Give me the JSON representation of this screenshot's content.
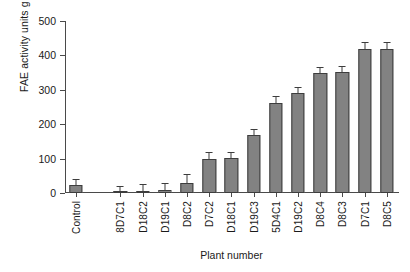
{
  "chart_data": {
    "type": "bar",
    "title": "",
    "xlabel": "Plant number",
    "ylabel": "FAE activity units g fresh wt",
    "ylabel_exponent": "−1",
    "ylim": [
      0,
      500
    ],
    "yticks": [
      0,
      100,
      200,
      300,
      400,
      500
    ],
    "grid": false,
    "legend": null,
    "bar_color": "#828282",
    "bar_edge_color": "#3d3d3d",
    "axis_color": "#4a4a4a",
    "categories": [
      "Control",
      "",
      "8D7C1",
      "D18C2",
      "D19C1",
      "D8C2",
      "D7C2",
      "D18C1",
      "D19C3",
      "5D4C1",
      "D19C2",
      "D8C4",
      "D8C3",
      "D7C1",
      "D8C5"
    ],
    "values": [
      23,
      null,
      2,
      7,
      10,
      30,
      98,
      101,
      168,
      262,
      290,
      348,
      353,
      420,
      420
    ],
    "errors": [
      15,
      null,
      16,
      17,
      16,
      21,
      18,
      16,
      16,
      17,
      15,
      14,
      14,
      16,
      16
    ]
  },
  "axis": {
    "y_tick_labels": [
      "0",
      "100",
      "200",
      "300",
      "400",
      "500"
    ],
    "x_title": "Plant number",
    "y_title_main": "FAE activity units g fresh wt",
    "y_title_sup": "−1"
  }
}
